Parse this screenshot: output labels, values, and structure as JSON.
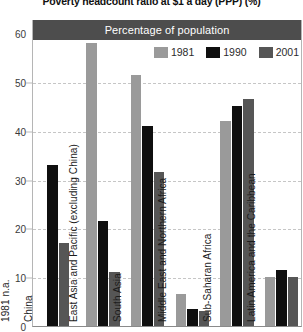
{
  "chart_title": "Poverty headcount ratio at $1 a day (PPP) (%)",
  "header_band": {
    "label": "Percentage of population"
  },
  "legend": {
    "position": "top-right",
    "items": [
      {
        "label": "1981",
        "color": "#9a9a9a"
      },
      {
        "label": "1990",
        "color": "#0f0f0f"
      },
      {
        "label": "2001",
        "color": "#565656"
      }
    ]
  },
  "y_axis": {
    "label": "",
    "ticks": [
      "0",
      "10",
      "20",
      "30",
      "40",
      "50",
      "60"
    ],
    "min": 0,
    "max": 60,
    "step": 10
  },
  "chart_data": {
    "type": "bar",
    "title": "Poverty headcount ratio at $1 a day (PPP) (%)",
    "subtitle": "Percentage of population",
    "xlabel": "",
    "ylabel": "Percentage of population",
    "ylim": [
      0,
      60
    ],
    "grid": true,
    "legend_position": "top-right",
    "categories": [
      "China",
      "East Asia and Pacific (excluding China)",
      "South Asia",
      "Middle East and Northern Africa",
      "Sub-Saharan Africa",
      "Latin America and the Caribbean"
    ],
    "category_display_labels": [
      "China",
      "East Asia and Pacific (excluding China)",
      "South Asia",
      "Middle East and Northern Africa",
      "Sub-Saharan Africa",
      "Latin America and the Caribbean"
    ],
    "series": [
      {
        "name": "1981",
        "color": "#9a9a9a",
        "values": [
          null,
          58.0,
          51.5,
          6.5,
          42.0,
          10.0
        ]
      },
      {
        "name": "1990",
        "color": "#0f0f0f",
        "values": [
          33.0,
          21.5,
          41.0,
          3.5,
          45.0,
          11.5
        ]
      },
      {
        "name": "2001",
        "color": "#565656",
        "values": [
          17.0,
          11.0,
          31.5,
          3.0,
          46.5,
          10.0
        ]
      }
    ],
    "notes": [
      {
        "text": "1981 n.a.",
        "category": "China",
        "series": "1981"
      }
    ]
  },
  "annotations": {
    "china_1981_na": "1981 n.a."
  }
}
